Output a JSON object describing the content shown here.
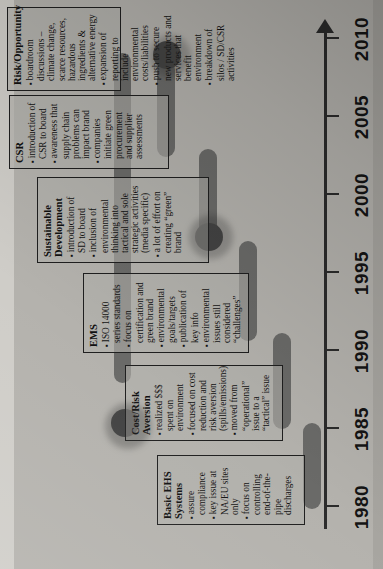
{
  "diagram": {
    "orientation": "rotated-90-ccw",
    "axis": {
      "label": "Timeline",
      "years": [
        "1980",
        "1985",
        "1990",
        "1995",
        "2000",
        "2005",
        "2010"
      ],
      "arrow_direction": "right"
    },
    "colors": {
      "page_background": "#b9b7b2",
      "bar": "#6a6a68",
      "bar_head": "#4e4e4d",
      "box_border": "#1f1f1f",
      "text": "#121212"
    },
    "stages": [
      {
        "name": "Basic EHS Systems",
        "title": "Basic EHS Systems",
        "bullets": [
          "assure compliance",
          "key issue at NA/EU sites only",
          "focus on controlling end-of-the-pipe discharges"
        ]
      },
      {
        "name": "Cost/Risk Aversion",
        "title": "Cost/Risk Aversion",
        "bullets": [
          "realized $$$ spent on environment",
          "focused on cost reduction and risk aversion (spills/emissions)",
          "moved from “operational” issue to a “tactical” issue"
        ]
      },
      {
        "name": "EMS",
        "title": "EMS",
        "bullets": [
          "ISO 14000 series standards",
          "focus on certification and green brand",
          "environmental goals/targets",
          "publication of key info",
          "environmental issues still considered “challenges”"
        ]
      },
      {
        "name": "Sustainable Development",
        "title": "Sustainable Development",
        "bullets": [
          "introduction of SD to board",
          "inclusion of environmental thinking into tactical and sole strategic activities (media specific)",
          "a lot of effort on creating “green” brand"
        ]
      },
      {
        "name": "CSR",
        "title": "CSR",
        "bullets": [
          "introduction of CSR to board",
          "awareness that supply chain problems can impact brand",
          "companies initiate green procurement and supplier assessments"
        ]
      },
      {
        "name": "Risk/Opportunity",
        "title": "Risk/Opportunity",
        "bullets": [
          "boardroom discussions – climate change, scarce resources, hazardous ingredients & alternative energy",
          "expansion of reporting to include environmental costs/liabilities",
          "push to secure new products and services that benefit environment",
          "breakdown of silos / SD/CSR activities"
        ]
      }
    ]
  }
}
